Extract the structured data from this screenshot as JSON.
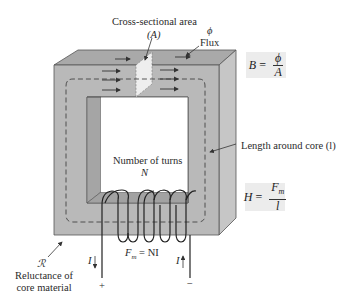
{
  "diagram": {
    "labels": {
      "cross_section": "Cross-sectional area",
      "cross_section_symbol": "(A)",
      "flux_symbol": "ϕ",
      "flux": "Flux",
      "length": "Length around core (l)",
      "turns": "Number of turns",
      "turns_symbol": "N",
      "mmf": "Fm = NI",
      "mmf_lhs": "F",
      "mmf_sub": "m",
      "mmf_rhs": "= NI",
      "reluctance_symbol": "ℛ",
      "reluctance_line1": "Reluctance of",
      "reluctance_line2": "core material",
      "current_left": "I",
      "current_right": "I",
      "plus": "+",
      "minus": "−"
    },
    "formulas": {
      "flux_density": {
        "lhs": "B",
        "eq": "=",
        "num": "ϕ",
        "den": "A"
      },
      "field_intensity": {
        "lhs": "H",
        "eq": "=",
        "num": "Fm",
        "num_main": "F",
        "num_sub": "m",
        "den": "l"
      }
    },
    "colors": {
      "core_front": "#b9b9b9",
      "core_top": "#a9a9a9",
      "core_side": "#c6c6c6",
      "formula_bg": "#ececec",
      "line": "#333333"
    }
  }
}
